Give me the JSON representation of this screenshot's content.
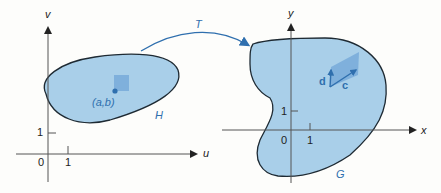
{
  "left_plane": {
    "x_axis_label": "u",
    "y_axis_label": "v",
    "origin_label": "0",
    "x_tick_label": "1",
    "y_tick_label": "1",
    "region_label": "H",
    "point_label": "(a,b)"
  },
  "transform": {
    "label": "T"
  },
  "right_plane": {
    "x_axis_label": "x",
    "y_axis_label": "y",
    "origin_label": "0",
    "x_tick_label": "1",
    "y_tick_label": "1",
    "region_label": "G",
    "vector_c_label": "c",
    "vector_d_label": "d"
  },
  "colors": {
    "region_fill": "#a9cfe9",
    "region_outline": "#1e2a33",
    "accent_blue": "#2f6fae",
    "small_patch": "#7fb0dc",
    "axis": "#555555"
  }
}
